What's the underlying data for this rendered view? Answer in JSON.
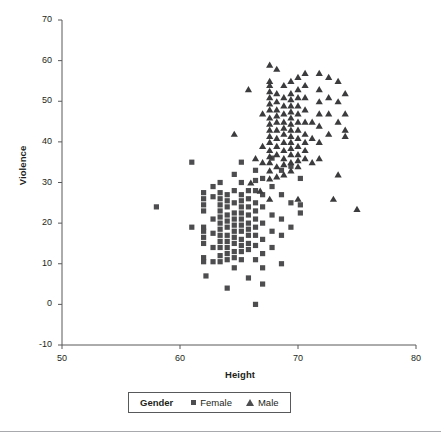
{
  "chart_data": {
    "type": "scatter",
    "title": "",
    "xlabel": "Height",
    "ylabel": "Violence",
    "xlim": [
      50,
      80
    ],
    "ylim": [
      -10,
      70
    ],
    "xticks": [
      50,
      60,
      70,
      80
    ],
    "yticks": [
      -10,
      0,
      10,
      20,
      30,
      40,
      50,
      60,
      70
    ],
    "grid": false,
    "legend_position": "bottom",
    "legend_title": "Gender",
    "series": [
      {
        "name": "Female",
        "marker": "square",
        "color": "#4d4d4f",
        "points": [
          [
            58.0,
            24.0
          ],
          [
            61.0,
            19.0
          ],
          [
            61.0,
            35.0
          ],
          [
            62.0,
            27.5
          ],
          [
            62.0,
            26.0
          ],
          [
            62.0,
            24.5
          ],
          [
            62.0,
            23.0
          ],
          [
            62.0,
            19.0
          ],
          [
            62.0,
            18.0
          ],
          [
            62.0,
            16.5
          ],
          [
            62.0,
            15.0
          ],
          [
            62.0,
            11.5
          ],
          [
            62.0,
            10.5
          ],
          [
            62.2,
            7.0
          ],
          [
            62.8,
            29.0
          ],
          [
            62.8,
            26.5
          ],
          [
            62.8,
            21.0
          ],
          [
            62.8,
            17.5
          ],
          [
            62.8,
            14.0
          ],
          [
            62.8,
            10.5
          ],
          [
            63.4,
            30.0
          ],
          [
            63.4,
            27.5
          ],
          [
            63.4,
            26.0
          ],
          [
            63.4,
            24.5
          ],
          [
            63.4,
            23.0
          ],
          [
            63.4,
            21.5
          ],
          [
            63.4,
            20.0
          ],
          [
            63.4,
            18.5
          ],
          [
            63.4,
            17.0
          ],
          [
            63.4,
            15.5
          ],
          [
            63.4,
            14.0
          ],
          [
            63.4,
            12.0
          ],
          [
            63.4,
            10.5
          ],
          [
            64.0,
            27.0
          ],
          [
            64.0,
            25.5
          ],
          [
            64.0,
            24.0
          ],
          [
            64.0,
            22.0
          ],
          [
            64.0,
            20.5
          ],
          [
            64.0,
            19.0
          ],
          [
            64.0,
            17.0
          ],
          [
            64.0,
            15.5
          ],
          [
            64.0,
            14.0
          ],
          [
            64.0,
            12.5
          ],
          [
            64.0,
            11.0
          ],
          [
            64.0,
            4.0
          ],
          [
            64.6,
            32.0
          ],
          [
            64.6,
            28.0
          ],
          [
            64.6,
            25.0
          ],
          [
            64.6,
            22.5
          ],
          [
            64.6,
            21.0
          ],
          [
            64.6,
            19.5
          ],
          [
            64.6,
            18.0
          ],
          [
            64.6,
            16.5
          ],
          [
            64.6,
            15.0
          ],
          [
            64.6,
            13.0
          ],
          [
            64.6,
            11.5
          ],
          [
            64.6,
            9.0
          ],
          [
            65.2,
            35.0
          ],
          [
            65.2,
            30.0
          ],
          [
            65.2,
            27.0
          ],
          [
            65.2,
            25.5
          ],
          [
            65.2,
            24.0
          ],
          [
            65.2,
            22.5
          ],
          [
            65.2,
            21.0
          ],
          [
            65.2,
            19.5
          ],
          [
            65.2,
            18.0
          ],
          [
            65.2,
            16.0
          ],
          [
            65.2,
            14.5
          ],
          [
            65.2,
            13.0
          ],
          [
            65.2,
            11.0
          ],
          [
            65.8,
            28.0
          ],
          [
            65.8,
            26.0
          ],
          [
            65.8,
            24.0
          ],
          [
            65.8,
            22.0
          ],
          [
            65.8,
            20.0
          ],
          [
            65.8,
            18.5
          ],
          [
            65.8,
            17.0
          ],
          [
            65.8,
            15.0
          ],
          [
            65.8,
            13.5
          ],
          [
            65.8,
            6.5
          ],
          [
            66.4,
            33.0
          ],
          [
            66.4,
            30.5
          ],
          [
            66.4,
            28.0
          ],
          [
            66.4,
            25.0
          ],
          [
            66.4,
            23.0
          ],
          [
            66.4,
            21.0
          ],
          [
            66.4,
            19.0
          ],
          [
            66.4,
            17.0
          ],
          [
            66.4,
            14.5
          ],
          [
            66.4,
            11.0
          ],
          [
            66.4,
            0.0
          ],
          [
            67.0,
            31.0
          ],
          [
            67.0,
            27.0
          ],
          [
            67.0,
            24.0
          ],
          [
            67.0,
            20.0
          ],
          [
            67.0,
            16.0
          ],
          [
            67.0,
            12.5
          ],
          [
            67.0,
            9.0
          ],
          [
            67.0,
            5.0
          ],
          [
            67.8,
            36.0
          ],
          [
            67.8,
            29.0
          ],
          [
            67.8,
            22.0
          ],
          [
            67.8,
            18.0
          ],
          [
            67.8,
            14.0
          ],
          [
            68.6,
            33.0
          ],
          [
            68.6,
            27.0
          ],
          [
            68.6,
            21.0
          ],
          [
            68.6,
            17.0
          ],
          [
            68.6,
            10.0
          ],
          [
            69.4,
            34.0
          ],
          [
            69.4,
            25.0
          ],
          [
            69.4,
            19.0
          ],
          [
            70.2,
            31.0
          ],
          [
            70.2,
            24.5
          ],
          [
            70.2,
            22.5
          ]
        ]
      },
      {
        "name": "Male",
        "marker": "triangle",
        "color": "#3b3b3d",
        "points": [
          [
            64.6,
            42.0
          ],
          [
            65.8,
            53.0
          ],
          [
            66.4,
            36.0
          ],
          [
            67.0,
            47.0
          ],
          [
            67.0,
            39.0
          ],
          [
            67.0,
            35.0
          ],
          [
            67.6,
            59.0
          ],
          [
            67.6,
            55.0
          ],
          [
            67.6,
            54.0
          ],
          [
            67.6,
            52.5
          ],
          [
            67.6,
            51.0
          ],
          [
            67.6,
            49.5
          ],
          [
            67.6,
            48.0
          ],
          [
            67.6,
            46.0
          ],
          [
            67.6,
            44.5
          ],
          [
            67.6,
            43.0
          ],
          [
            67.6,
            41.5
          ],
          [
            67.6,
            40.0
          ],
          [
            67.6,
            38.0
          ],
          [
            67.6,
            36.5
          ],
          [
            67.6,
            35.0
          ],
          [
            67.6,
            33.0
          ],
          [
            67.6,
            31.0
          ],
          [
            67.6,
            26.0
          ],
          [
            68.2,
            58.0
          ],
          [
            68.2,
            52.0
          ],
          [
            68.2,
            50.0
          ],
          [
            68.2,
            48.0
          ],
          [
            68.2,
            46.5
          ],
          [
            68.2,
            45.0
          ],
          [
            68.2,
            43.0
          ],
          [
            68.2,
            41.0
          ],
          [
            68.2,
            39.0
          ],
          [
            68.2,
            37.0
          ],
          [
            68.2,
            34.0
          ],
          [
            68.2,
            31.5
          ],
          [
            68.8,
            54.0
          ],
          [
            68.8,
            51.0
          ],
          [
            68.8,
            49.0
          ],
          [
            68.8,
            47.0
          ],
          [
            68.8,
            45.0
          ],
          [
            68.8,
            43.5
          ],
          [
            68.8,
            42.0
          ],
          [
            68.8,
            40.0
          ],
          [
            68.8,
            38.0
          ],
          [
            68.8,
            36.0
          ],
          [
            68.8,
            34.5
          ],
          [
            68.8,
            32.0
          ],
          [
            69.4,
            55.0
          ],
          [
            69.4,
            52.0
          ],
          [
            69.4,
            50.5
          ],
          [
            69.4,
            49.0
          ],
          [
            69.4,
            47.5
          ],
          [
            69.4,
            46.0
          ],
          [
            69.4,
            44.5
          ],
          [
            69.4,
            43.0
          ],
          [
            69.4,
            41.5
          ],
          [
            69.4,
            40.0
          ],
          [
            69.4,
            38.5
          ],
          [
            69.4,
            37.0
          ],
          [
            69.4,
            35.0
          ],
          [
            69.4,
            33.0
          ],
          [
            70.0,
            56.0
          ],
          [
            70.0,
            53.0
          ],
          [
            70.0,
            51.0
          ],
          [
            70.0,
            49.0
          ],
          [
            70.0,
            47.0
          ],
          [
            70.0,
            45.0
          ],
          [
            70.0,
            43.0
          ],
          [
            70.0,
            41.0
          ],
          [
            70.0,
            39.0
          ],
          [
            70.0,
            37.0
          ],
          [
            70.0,
            35.5
          ],
          [
            70.0,
            34.0
          ],
          [
            70.0,
            26.0
          ],
          [
            70.6,
            57.0
          ],
          [
            70.6,
            54.0
          ],
          [
            70.6,
            51.0
          ],
          [
            70.6,
            48.0
          ],
          [
            70.6,
            45.0
          ],
          [
            70.6,
            42.0
          ],
          [
            70.6,
            40.0
          ],
          [
            70.6,
            38.0
          ],
          [
            70.6,
            36.0
          ],
          [
            71.2,
            45.0
          ],
          [
            71.2,
            41.0
          ],
          [
            71.2,
            35.0
          ],
          [
            71.8,
            57.0
          ],
          [
            71.8,
            53.0
          ],
          [
            71.8,
            50.0
          ],
          [
            71.8,
            47.0
          ],
          [
            71.8,
            44.0
          ],
          [
            71.8,
            40.0
          ],
          [
            71.8,
            36.0
          ],
          [
            72.6,
            56.0
          ],
          [
            72.6,
            51.0
          ],
          [
            72.6,
            47.0
          ],
          [
            72.6,
            42.0
          ],
          [
            73.4,
            55.0
          ],
          [
            73.4,
            50.0
          ],
          [
            73.4,
            45.0
          ],
          [
            73.4,
            32.0
          ],
          [
            74.0,
            52.0
          ],
          [
            74.0,
            47.0
          ],
          [
            74.0,
            43.0
          ],
          [
            74.0,
            41.5
          ],
          [
            75.0,
            23.5
          ],
          [
            73.0,
            26.0
          ],
          [
            66.0,
            30.0
          ],
          [
            66.8,
            28.0
          ]
        ]
      }
    ]
  },
  "axes": {
    "ylabel": "Violence",
    "xlabel": "Height",
    "ytick_labels": [
      "70",
      "60",
      "50",
      "40",
      "30",
      "20",
      "10",
      "0",
      "-10"
    ],
    "xtick_labels": [
      "50",
      "60",
      "70",
      "80"
    ]
  },
  "legend": {
    "title": "Gender",
    "entries": [
      {
        "label": "Female",
        "marker": "square-marker"
      },
      {
        "label": "Male",
        "marker": "triangle-marker"
      }
    ]
  },
  "colors": {
    "female": "#4d4d4f",
    "male": "#3b3b3d",
    "axis": "#58595b",
    "text": "#231f20"
  }
}
